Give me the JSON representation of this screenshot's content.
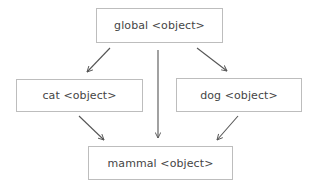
{
  "diagram": {
    "type": "object-graph",
    "colors": {
      "background": "#ffffff",
      "node_border": "#bdbdbd",
      "node_text": "#454545",
      "edge": "#555555"
    },
    "nodes": [
      {
        "id": "global",
        "label": "global <object>"
      },
      {
        "id": "cat",
        "label": "cat <object>"
      },
      {
        "id": "dog",
        "label": "dog <object>"
      },
      {
        "id": "mammal",
        "label": "mammal <object>"
      }
    ],
    "edges": [
      {
        "from": "global",
        "to": "cat"
      },
      {
        "from": "global",
        "to": "mammal"
      },
      {
        "from": "global",
        "to": "dog"
      },
      {
        "from": "cat",
        "to": "mammal"
      },
      {
        "from": "dog",
        "to": "mammal"
      }
    ]
  }
}
